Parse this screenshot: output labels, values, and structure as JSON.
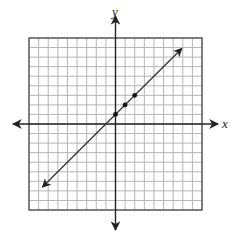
{
  "chart_data": {
    "type": "line",
    "title": "",
    "xlabel": "x",
    "ylabel": "y",
    "xlim": [
      -9,
      9
    ],
    "ylim": [
      -9,
      9
    ],
    "grid": true,
    "grid_step": 1,
    "axis_ticks_labeled": false,
    "series": [
      {
        "name": "line",
        "equation": "y = x + 1",
        "x": [
          -7.6,
          6.9
        ],
        "y": [
          -6.6,
          7.9
        ],
        "arrows": "both"
      }
    ],
    "points": [
      {
        "x": 0,
        "y": 1
      },
      {
        "x": 1,
        "y": 2
      },
      {
        "x": 2,
        "y": 3
      }
    ]
  },
  "labels": {
    "x_axis": "x",
    "y_axis": "y"
  },
  "colors": {
    "grid": "#b5b5b5",
    "axis": "#222222",
    "line": "#333333",
    "border": "#444444"
  }
}
